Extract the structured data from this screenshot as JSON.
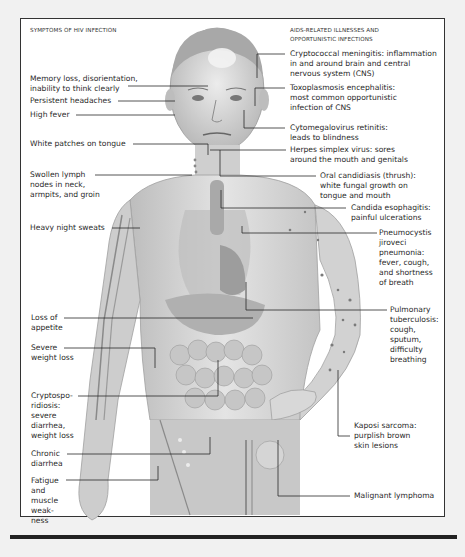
{
  "left_header": "SYMPTOMS OF HIV INFECTION",
  "right_header": "AIDS-RELATED ILLNESSES AND\nOPPORTUNISTIC INFECTIONS",
  "symptoms": [
    {
      "id": "memory",
      "text": "Memory loss, disorientation,\ninability to think clearly"
    },
    {
      "id": "headache",
      "text": "Persistent headaches"
    },
    {
      "id": "fever",
      "text": "High fever"
    },
    {
      "id": "tongue",
      "text": "White patches on tongue"
    },
    {
      "id": "lymph",
      "text": "Swollen lymph\nnodes in neck,\narmpits, and groin"
    },
    {
      "id": "sweats",
      "text": "Heavy night sweats"
    },
    {
      "id": "appetite",
      "text": "Loss of\nappetite"
    },
    {
      "id": "weightloss",
      "text": "Severe\nweight loss"
    },
    {
      "id": "crypto",
      "text": "Cryptospo-\nridiosis:\nsevere\ndiarrhea,\nweight loss"
    },
    {
      "id": "diarrhea",
      "text": "Chronic\ndiarrhea"
    },
    {
      "id": "fatigue",
      "text": "Fatigue\nand\nmuscle\nweak-\nness"
    }
  ],
  "illnesses": [
    {
      "id": "meningitis",
      "text": "Cryptococcal meningitis: inflammation\nin and around brain and central\nnervous system (CNS)"
    },
    {
      "id": "toxo",
      "text": "Toxoplasmosis encephalitis:\nmost common opportunistic\ninfection of CNS"
    },
    {
      "id": "cmv",
      "text": "Cytomegalovirus retinitis:\nleads to blindness"
    },
    {
      "id": "herpes",
      "text": "Herpes simplex virus: sores\naround the mouth and genitals"
    },
    {
      "id": "thrush",
      "text": "Oral candidiasis (thrush):\nwhite fungal growth on\ntongue and mouth"
    },
    {
      "id": "esophagitis",
      "text": "Candida esophagitis:\npainful ulcerations"
    },
    {
      "id": "pcp",
      "text": "Pneumocystis\njiroveci\npneumonia:\nfever, cough,\nand shortness\nof breath"
    },
    {
      "id": "tb",
      "text": "Pulmonary\ntuberculosis:\ncough,\nsputum,\ndifficulty\nbreathing"
    },
    {
      "id": "kaposi",
      "text": "Kaposi sarcoma:\npurplish brown\nskin lesions"
    },
    {
      "id": "lymphoma",
      "text": "Malignant lymphoma"
    }
  ],
  "colors": {
    "frame_border": "#333333",
    "leader_line": "#2a2a2a",
    "skin_light": "#e6e6e6",
    "skin_mid": "#c9c9c9",
    "skin_dark": "#9a9a9a",
    "lesion": "#7a7a7a"
  }
}
